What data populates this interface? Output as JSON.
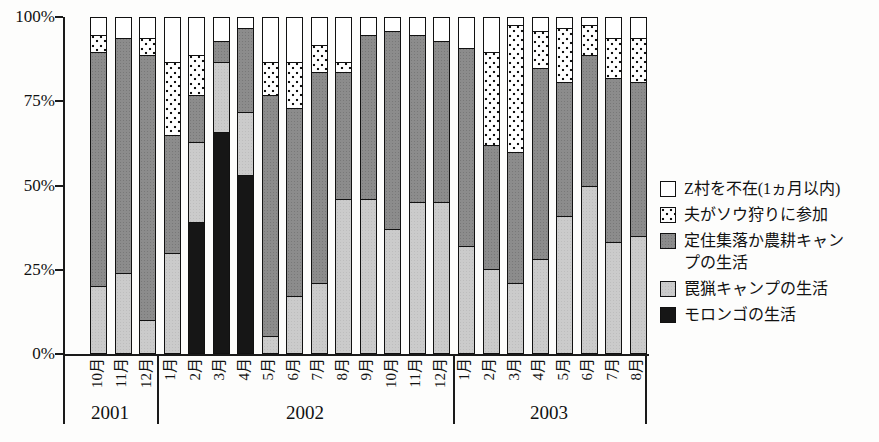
{
  "chart_data": {
    "type": "bar",
    "stacked": true,
    "percent_stacked": true,
    "title": "",
    "xlabel": "",
    "ylabel": "",
    "ylim": [
      0,
      100
    ],
    "grid": false,
    "legend_position": "right",
    "y_ticks": [
      {
        "label": "0%",
        "pct": 0
      },
      {
        "label": "25%",
        "pct": 25
      },
      {
        "label": "50%",
        "pct": 50
      },
      {
        "label": "75%",
        "pct": 75
      },
      {
        "label": "100%",
        "pct": 100
      }
    ],
    "categories": [
      "10月",
      "11月",
      "12月",
      "1月",
      "2月",
      "3月",
      "4月",
      "5月",
      "6月",
      "7月",
      "8月",
      "9月",
      "10月",
      "11月",
      "12月",
      "1月",
      "2月",
      "3月",
      "4月",
      "5月",
      "6月",
      "7月",
      "8月"
    ],
    "year_groups": [
      {
        "year": "2001",
        "months": 3
      },
      {
        "year": "2002",
        "months": 12
      },
      {
        "year": "2003",
        "months": 8
      }
    ],
    "series": [
      {
        "name": "モロンゴの生活",
        "pattern": "black",
        "values": [
          0,
          0,
          0,
          0,
          39,
          66,
          53,
          0,
          0,
          0,
          0,
          0,
          0,
          0,
          0,
          0,
          0,
          0,
          0,
          0,
          0,
          0,
          0
        ]
      },
      {
        "name": "罠猟キャンプの生活",
        "pattern": "light",
        "values": [
          20,
          24,
          10,
          30,
          24,
          21,
          19,
          5,
          17,
          21,
          46,
          46,
          37,
          45,
          45,
          32,
          25,
          21,
          28,
          41,
          50,
          33,
          35
        ]
      },
      {
        "name": "定住集落か農耕キャンプの生活",
        "pattern": "dark",
        "values": [
          70,
          70,
          79,
          35,
          14,
          6,
          25,
          72,
          56,
          63,
          38,
          49,
          59,
          50,
          48,
          59,
          37,
          39,
          57,
          40,
          39,
          49,
          46
        ]
      },
      {
        "name": "夫がソウ狩りに参加",
        "pattern": "dotted",
        "values": [
          5,
          0,
          5,
          22,
          12,
          0,
          0,
          10,
          14,
          8,
          3,
          0,
          0,
          0,
          0,
          0,
          28,
          38,
          11,
          16,
          9,
          12,
          13
        ]
      },
      {
        "name": "Z村を不在(1ヵ月以内)",
        "pattern": "white",
        "values": [
          5,
          6,
          6,
          13,
          11,
          7,
          3,
          13,
          13,
          8,
          13,
          5,
          4,
          5,
          7,
          9,
          10,
          2,
          4,
          3,
          2,
          6,
          6
        ]
      }
    ],
    "legend": [
      {
        "label": "Z村を不在(1ヵ月以内)",
        "pattern": "white"
      },
      {
        "label": "夫がソウ狩りに参加",
        "pattern": "dotted"
      },
      {
        "label": "定住集落か農耕キャンプの生活",
        "pattern": "dark"
      },
      {
        "label": "罠猟キャンプの生活",
        "pattern": "light"
      },
      {
        "label": "モロンゴの生活",
        "pattern": "black"
      }
    ],
    "colors": {
      "black": "#161616",
      "light_gray": "#cbcbcb",
      "dark_gray": "#8c8c8c",
      "white": "#ffffff",
      "axis": "#1a1a1a"
    }
  }
}
